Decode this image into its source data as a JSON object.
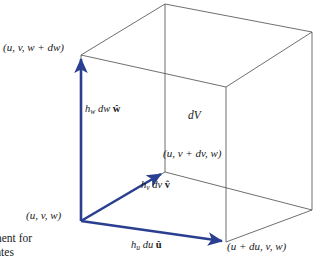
{
  "figure": {
    "colors": {
      "vector_blue": "#2a3f8f",
      "cube_line": "#4a4a4a",
      "text": "#1a1a1a",
      "background": "#ffffff"
    },
    "volume_label": "dV",
    "vertices": [
      {
        "name": "origin-vertex",
        "label": "(u, v, w)"
      },
      {
        "name": "top-vertex",
        "label": "(u, v, w + dw)"
      },
      {
        "name": "depth-vertex",
        "label": "(u, v + dv, w)"
      },
      {
        "name": "right-vertex",
        "label": "(u + du, v, w)"
      }
    ],
    "vectors": [
      {
        "name": "w-vector",
        "coeff": "h",
        "sub": "w",
        "diff": "dw",
        "unit": "ŵ",
        "label": "h_w dw ŵ"
      },
      {
        "name": "v-vector",
        "coeff": "h",
        "sub": "v",
        "diff": "dv",
        "unit": "v̂",
        "label": "h_v dv v̂"
      },
      {
        "name": "u-vector",
        "coeff": "h",
        "sub": "u",
        "diff": "du",
        "unit": "û",
        "label": "h_u du û"
      }
    ],
    "caption": {
      "line1": "nent for",
      "line2": "ates"
    }
  }
}
